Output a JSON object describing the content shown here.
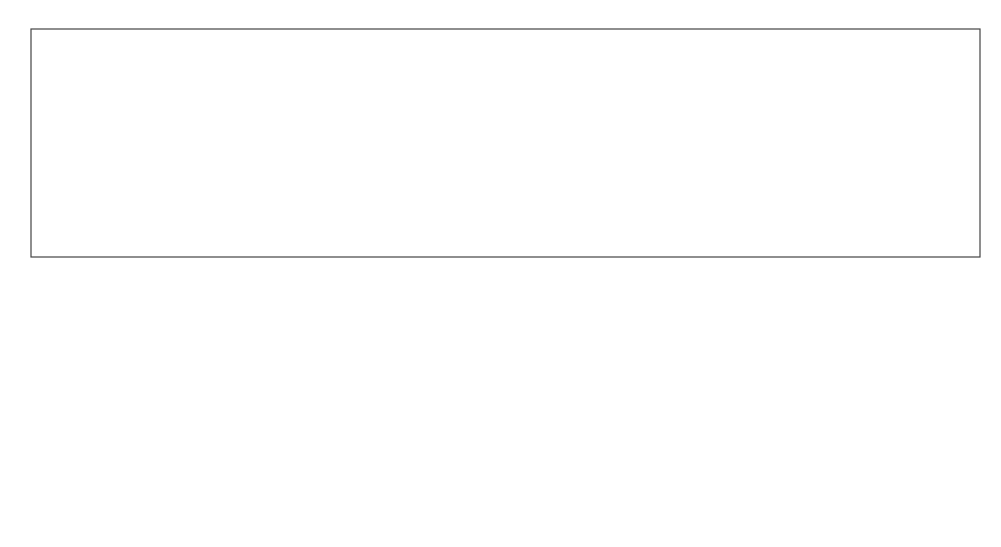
{
  "diagram": {
    "root": {
      "label": "SOFTWARE\nMACHINE"
    },
    "concept": {
      "label": "CONCEPT"
    },
    "implementation": {
      "label": "IMPLEMENTATION"
    },
    "concept_cloud": {
      "info_flow_label": "Information\nflow",
      "processing_unit_label": "Software\nprocessing\nunit"
    },
    "implementation_cloud": {
      "subprogram": {
        "label": "SUBPROGRAM"
      },
      "procedure": {
        "label": "Procedure"
      },
      "function": {
        "label": "Function"
      }
    },
    "colors": {
      "stroke": "#222222",
      "text": "#333333",
      "background": "#ffffff"
    }
  }
}
